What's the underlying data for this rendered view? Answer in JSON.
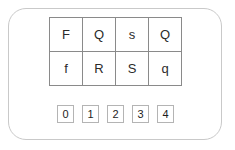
{
  "card": {
    "border_color": "#c9c9c9",
    "background": "#ffffff"
  },
  "letter_grid": {
    "border_color": "#8a8a8a",
    "rows": [
      [
        "F",
        "Q",
        "s",
        "Q"
      ],
      [
        "f",
        "R",
        "S",
        "q"
      ]
    ]
  },
  "number_buttons": {
    "border_color": "#b4b4b4",
    "items": [
      "0",
      "1",
      "2",
      "3",
      "4"
    ]
  }
}
